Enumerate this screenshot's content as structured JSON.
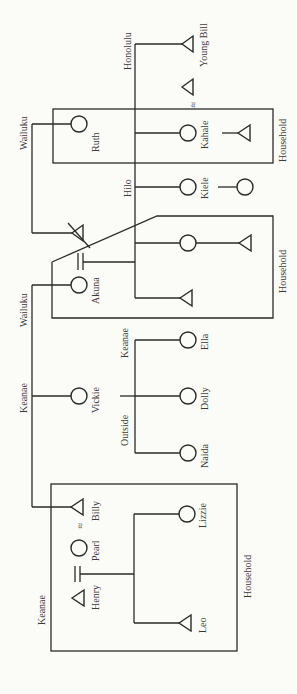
{
  "diagram": {
    "type": "kinship-chart",
    "orientation": "rotated-90",
    "places": {
      "honolulu": "Honolulu",
      "wailuku_top": "Wailuku",
      "hilo": "Hilo",
      "wailuku_mid": "Wailuku",
      "keanae_mid": "Keanae",
      "keanae_children": "Keanae",
      "outside": "Outside",
      "keanae_bottom": "Keanae"
    },
    "households": {
      "top": "Household",
      "middle": "Household",
      "bottom": "Household"
    },
    "people": {
      "young_bill": "Young Bill",
      "ruth": "Ruth",
      "kahale": "Kahale",
      "kiele": "Kiele",
      "akuna": "Akuna",
      "vickie": "Vickie",
      "ella": "Ella",
      "dolly": "Dolly",
      "naida": "Naida",
      "billy": "Billy",
      "pearl": "Pearl",
      "henry": "Henry",
      "lizzie": "Lizzie",
      "leo": "Leo"
    },
    "symbols": {
      "male": "triangle",
      "female": "circle",
      "marriage": "=",
      "informal_union": "≈",
      "deceased": "strikethrough"
    }
  }
}
